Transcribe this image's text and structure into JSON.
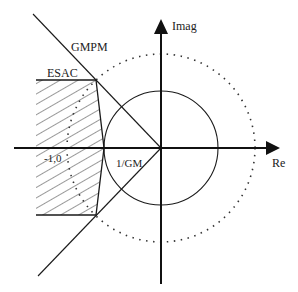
{
  "diagram": {
    "type": "nyquist-plane-stability-regions",
    "axes": {
      "x_label": "Re",
      "y_label": "Imag"
    },
    "labels": {
      "gmpm": "GMPM",
      "esac": "ESAC",
      "critical_point": "-1,0",
      "gain_margin": "1/GM"
    },
    "elements": [
      {
        "name": "unit-circle",
        "style": "solid"
      },
      {
        "name": "outer-circle",
        "style": "dotted"
      },
      {
        "name": "gmpm-boundary-lines",
        "style": "solid"
      },
      {
        "name": "esac-region",
        "style": "hatched"
      }
    ],
    "colors": {
      "stroke": "#1a1a1a",
      "background": "#ffffff"
    }
  }
}
